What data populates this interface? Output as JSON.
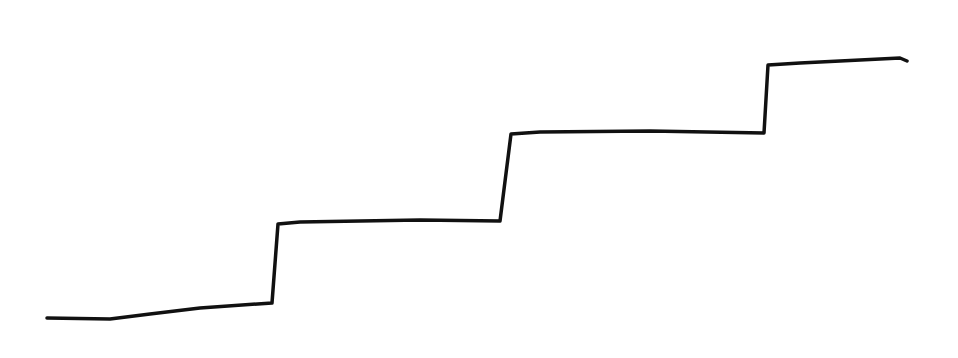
{
  "diagram": {
    "type": "staircase-line-sketch",
    "stroke_color": "#111111",
    "background": "#ffffff",
    "stroke_width": 3.5,
    "path_points": [
      [
        47,
        318
      ],
      [
        110,
        319
      ],
      [
        150,
        314
      ],
      [
        200,
        308
      ],
      [
        272,
        303
      ],
      [
        278,
        224
      ],
      [
        300,
        222
      ],
      [
        420,
        220
      ],
      [
        500,
        221
      ],
      [
        511,
        134
      ],
      [
        540,
        132
      ],
      [
        650,
        131
      ],
      [
        764,
        133
      ],
      [
        768,
        65
      ],
      [
        800,
        63
      ],
      [
        900,
        58
      ],
      [
        907,
        61
      ]
    ],
    "steps": 4
  }
}
